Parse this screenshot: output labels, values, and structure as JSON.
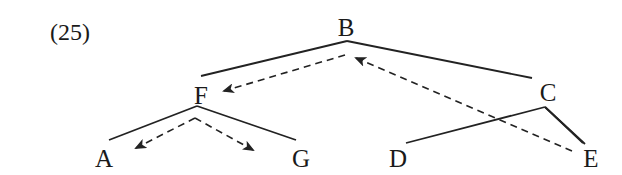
{
  "example_number": "(25)",
  "nodes": {
    "B": {
      "label": "B",
      "x": 346,
      "y": 36
    },
    "F": {
      "label": "F",
      "x": 201,
      "y": 104
    },
    "C": {
      "label": "C",
      "x": 548,
      "y": 101
    },
    "A": {
      "label": "A",
      "x": 104,
      "y": 167
    },
    "G": {
      "label": "G",
      "x": 301,
      "y": 167
    },
    "D": {
      "label": "D",
      "x": 398,
      "y": 167
    },
    "E": {
      "label": "E",
      "x": 591,
      "y": 167
    }
  },
  "edges": [
    {
      "from": "B",
      "to": "F"
    },
    {
      "from": "B",
      "to": "C"
    },
    {
      "from": "F",
      "to": "A"
    },
    {
      "from": "F",
      "to": "G"
    },
    {
      "from": "C",
      "to": "D"
    },
    {
      "from": "C",
      "to": "E"
    }
  ],
  "movement_arrows": [
    {
      "from": "B",
      "to": "F",
      "style": "dashed"
    },
    {
      "from": "E",
      "to": "B",
      "style": "dashed"
    },
    {
      "from": "F",
      "to": "A",
      "style": "dashed"
    },
    {
      "from": "F",
      "to": "G",
      "style": "dashed"
    }
  ],
  "colors": {
    "ink": "#222222",
    "background": "#ffffff"
  }
}
